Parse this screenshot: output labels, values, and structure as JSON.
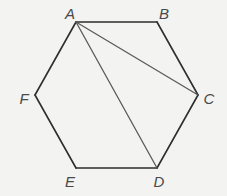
{
  "diagram": {
    "background": "#f3f3f1",
    "edge_color": "#2e2e2e",
    "diagonal_color": "#5a5a5a",
    "vertices": [
      {
        "name": "A",
        "x": 76,
        "y": 22,
        "label_x": 70,
        "label_y": 13
      },
      {
        "name": "B",
        "x": 157,
        "y": 22,
        "label_x": 164,
        "label_y": 13
      },
      {
        "name": "C",
        "x": 198,
        "y": 95,
        "label_x": 209,
        "label_y": 98
      },
      {
        "name": "D",
        "x": 157,
        "y": 168,
        "label_x": 159,
        "label_y": 181
      },
      {
        "name": "E",
        "x": 76,
        "y": 168,
        "label_x": 70,
        "label_y": 181
      },
      {
        "name": "F",
        "x": 35,
        "y": 95,
        "label_x": 24,
        "label_y": 98
      }
    ],
    "edges": [
      [
        "A",
        "B"
      ],
      [
        "B",
        "C"
      ],
      [
        "C",
        "D"
      ],
      [
        "D",
        "E"
      ],
      [
        "E",
        "F"
      ],
      [
        "F",
        "A"
      ]
    ],
    "diagonals": [
      [
        "A",
        "C"
      ],
      [
        "A",
        "D"
      ]
    ],
    "labels": {
      "A": "A",
      "B": "B",
      "C": "C",
      "D": "D",
      "E": "E",
      "F": "F"
    }
  }
}
